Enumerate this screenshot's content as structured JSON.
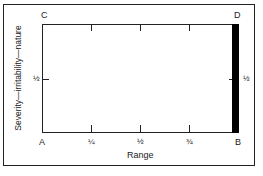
{
  "diagram": {
    "corners": {
      "top_left": "C",
      "top_right": "D",
      "bottom_left": "A",
      "bottom_right": "B"
    },
    "x_axis": {
      "title": "Range",
      "ticks": [
        "¼",
        "½",
        "¾"
      ],
      "tick_values": [
        0.25,
        0.5,
        0.75
      ]
    },
    "y_axis": {
      "title": "Severity—irritability—nature",
      "left_tick": "½",
      "right_tick": "½",
      "tick_value": 0.5
    },
    "highlight_bar": {
      "description": "solid black bar along right edge from B to D",
      "color": "#000000"
    },
    "colors": {
      "line": "#222222",
      "background": "#ffffff",
      "bar": "#000000"
    }
  }
}
